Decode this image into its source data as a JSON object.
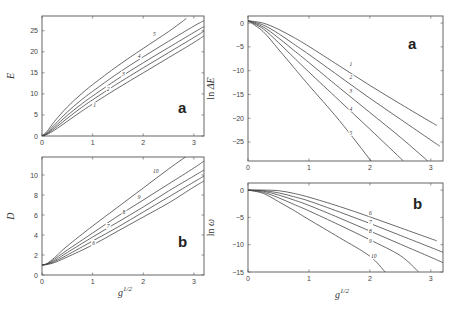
{
  "chart_data": [
    {
      "type": "line",
      "panel": "top-left",
      "panel_label": "a",
      "xlabel": "",
      "ylabel": "E",
      "xlim": [
        0,
        3.2
      ],
      "ylim": [
        0,
        28.5
      ],
      "xticks": [
        0,
        1,
        2,
        3
      ],
      "yticks": [
        0,
        5,
        10,
        15,
        20,
        25
      ],
      "xtick_labels": [
        "0",
        "1",
        "2",
        "3"
      ],
      "ytick_labels": [
        "0",
        "5",
        "10",
        "15",
        "20",
        "25"
      ],
      "grid": false,
      "series": [
        {
          "name": "1",
          "x": [
            0,
            0.1,
            0.25,
            0.5,
            0.75,
            1.0,
            1.5,
            2.0,
            2.5,
            3.0,
            3.2
          ],
          "y": [
            0,
            0.4,
            1.4,
            3.5,
            5.6,
            7.6,
            11.4,
            15.0,
            18.6,
            22.2,
            23.8
          ]
        },
        {
          "name": "2",
          "x": [
            0,
            0.1,
            0.25,
            0.5,
            0.75,
            1.0,
            1.5,
            2.0,
            2.5,
            3.0,
            3.2
          ],
          "y": [
            0,
            0.5,
            1.8,
            4.2,
            6.5,
            8.6,
            12.5,
            16.2,
            19.8,
            23.4,
            24.9
          ]
        },
        {
          "name": "3",
          "x": [
            0,
            0.1,
            0.25,
            0.5,
            0.75,
            1.0,
            1.5,
            2.0,
            2.5,
            3.0,
            3.2
          ],
          "y": [
            0,
            0.6,
            2.2,
            4.9,
            7.3,
            9.5,
            13.6,
            17.4,
            21.0,
            24.6,
            26.0
          ]
        },
        {
          "name": "4",
          "x": [
            0,
            0.1,
            0.25,
            0.5,
            0.75,
            1.0,
            1.5,
            2.0,
            2.5,
            3.0,
            3.2
          ],
          "y": [
            0,
            0.8,
            2.7,
            5.7,
            8.3,
            10.6,
            14.9,
            18.8,
            22.5,
            26.1,
            27.4
          ]
        },
        {
          "name": "5",
          "x": [
            0,
            0.1,
            0.25,
            0.5,
            0.75,
            1.0,
            1.5,
            2.0,
            2.5,
            2.85
          ],
          "y": [
            0,
            1.1,
            3.5,
            6.9,
            9.7,
            12.2,
            16.7,
            20.8,
            24.8,
            27.9
          ]
        }
      ],
      "curve_label_positions": [
        {
          "name": "1",
          "x": 1.05,
          "y": 6.8
        },
        {
          "name": "2",
          "x": 1.32,
          "y": 10.8
        },
        {
          "name": "3",
          "x": 1.62,
          "y": 14.3
        },
        {
          "name": "4",
          "x": 1.93,
          "y": 18.5
        },
        {
          "name": "5",
          "x": 2.23,
          "y": 23.8
        }
      ]
    },
    {
      "type": "line",
      "panel": "bottom-left",
      "panel_label": "b",
      "xlabel": "g^1/2",
      "ylabel": "D",
      "xlim": [
        0,
        3.2
      ],
      "ylim": [
        0,
        11.8
      ],
      "xticks": [
        0,
        1,
        2,
        3
      ],
      "yticks": [
        0,
        2,
        4,
        6,
        8,
        10
      ],
      "xtick_labels": [
        "0",
        "1",
        "2",
        "3"
      ],
      "ytick_labels": [
        "0",
        "2",
        "4",
        "6",
        "8",
        "10"
      ],
      "grid": false,
      "series": [
        {
          "name": "6",
          "x": [
            0,
            0.1,
            0.25,
            0.5,
            1.0,
            1.5,
            2.0,
            2.5,
            3.0,
            3.2
          ],
          "y": [
            1,
            1.05,
            1.25,
            1.8,
            3.0,
            4.4,
            5.8,
            7.2,
            8.8,
            9.4
          ]
        },
        {
          "name": "7",
          "x": [
            0,
            0.1,
            0.25,
            0.5,
            1.0,
            1.5,
            2.0,
            2.5,
            3.0,
            3.2
          ],
          "y": [
            1,
            1.08,
            1.35,
            2.0,
            3.4,
            4.8,
            6.3,
            7.8,
            9.3,
            9.9
          ]
        },
        {
          "name": "8",
          "x": [
            0,
            0.1,
            0.25,
            0.5,
            1.0,
            1.5,
            2.0,
            2.5,
            3.0,
            3.2
          ],
          "y": [
            1,
            1.1,
            1.45,
            2.25,
            3.8,
            5.3,
            6.8,
            8.4,
            9.9,
            10.5
          ]
        },
        {
          "name": "9",
          "x": [
            0,
            0.1,
            0.25,
            0.5,
            1.0,
            1.5,
            2.0,
            2.5,
            3.0,
            3.2
          ],
          "y": [
            1,
            1.12,
            1.6,
            2.5,
            4.2,
            5.9,
            7.5,
            9.1,
            10.7,
            11.4
          ]
        },
        {
          "name": "10",
          "x": [
            0,
            0.1,
            0.25,
            0.5,
            1.0,
            1.5,
            2.0,
            2.5,
            3.0
          ],
          "y": [
            1,
            1.15,
            1.75,
            2.9,
            4.9,
            6.8,
            8.7,
            10.6,
            12.4
          ]
        }
      ],
      "curve_label_positions": [
        {
          "name": "6",
          "x": 1.03,
          "y": 3.0
        },
        {
          "name": "7",
          "x": 1.32,
          "y": 4.7
        },
        {
          "name": "8",
          "x": 1.63,
          "y": 6.1
        },
        {
          "name": "9",
          "x": 1.93,
          "y": 7.6
        },
        {
          "name": "10",
          "x": 2.23,
          "y": 10.2
        }
      ]
    },
    {
      "type": "line",
      "panel": "top-right",
      "panel_label": "a",
      "xlabel": "",
      "ylabel": "ln ΔE",
      "xlim": [
        0,
        3.2
      ],
      "ylim": [
        -29,
        1.5
      ],
      "xticks": [
        0,
        1,
        2,
        3
      ],
      "yticks": [
        0,
        -5,
        -10,
        -15,
        -20,
        -25
      ],
      "xtick_labels": [
        "0",
        "1",
        "2",
        "3"
      ],
      "ytick_labels": [
        "0",
        "−5",
        "−10",
        "−15",
        "−20",
        "−25"
      ],
      "grid": false,
      "series": [
        {
          "name": "1",
          "x": [
            0,
            0.25,
            0.5,
            0.75,
            1.0,
            1.5,
            2.0,
            2.5,
            3.0,
            3.1
          ],
          "y": [
            0.5,
            0.0,
            -1.3,
            -3.0,
            -4.9,
            -9.0,
            -13.1,
            -17.0,
            -20.8,
            -21.5
          ]
        },
        {
          "name": "2",
          "x": [
            0,
            0.25,
            0.5,
            0.75,
            1.0,
            1.5,
            2.0,
            2.5,
            3.0,
            3.15
          ],
          "y": [
            0.5,
            -0.4,
            -2.2,
            -4.4,
            -6.6,
            -11.2,
            -15.8,
            -20.2,
            -24.6,
            -25.9
          ]
        },
        {
          "name": "3",
          "x": [
            0,
            0.25,
            0.5,
            0.75,
            1.0,
            1.5,
            2.0,
            2.5,
            2.95
          ],
          "y": [
            0.5,
            -0.8,
            -3.1,
            -5.7,
            -8.3,
            -13.6,
            -18.8,
            -24.0,
            -29.0
          ]
        },
        {
          "name": "4",
          "x": [
            0,
            0.25,
            0.5,
            0.75,
            1.0,
            1.5,
            2.0,
            2.55
          ],
          "y": [
            0.5,
            -1.2,
            -4.1,
            -7.2,
            -10.3,
            -16.3,
            -22.3,
            -29.0
          ]
        },
        {
          "name": "5",
          "x": [
            0,
            0.25,
            0.5,
            0.75,
            1.0,
            1.5,
            2.02
          ],
          "y": [
            0.5,
            -1.8,
            -5.5,
            -9.3,
            -13.1,
            -20.5,
            -29.0
          ]
        }
      ],
      "curve_label_positions": [
        {
          "name": "1",
          "x": 1.7,
          "y": -9.0
        },
        {
          "name": "2",
          "x": 1.7,
          "y": -11.8
        },
        {
          "name": "3",
          "x": 1.7,
          "y": -14.8
        },
        {
          "name": "4",
          "x": 1.7,
          "y": -18.4
        },
        {
          "name": "5",
          "x": 1.7,
          "y": -23.5
        }
      ]
    },
    {
      "type": "line",
      "panel": "bottom-right",
      "panel_label": "b",
      "xlabel": "g^1/2",
      "ylabel": "ln ω",
      "xlim": [
        0,
        3.2
      ],
      "ylim": [
        -15,
        1.3
      ],
      "xticks": [
        0,
        1,
        2,
        3
      ],
      "yticks": [
        0,
        -5,
        -10,
        -15
      ],
      "xtick_labels": [
        "0",
        "1",
        "2",
        "3"
      ],
      "ytick_labels": [
        "0",
        "−5",
        "−10",
        "−15"
      ],
      "grid": false,
      "series": [
        {
          "name": "6",
          "x": [
            0,
            0.25,
            0.5,
            0.75,
            1.0,
            1.5,
            2.0,
            2.5,
            3.0,
            3.1
          ],
          "y": [
            0,
            0.0,
            -0.1,
            -0.6,
            -1.3,
            -3.0,
            -4.9,
            -6.9,
            -8.9,
            -9.3
          ]
        },
        {
          "name": "7",
          "x": [
            0,
            0.25,
            0.5,
            0.75,
            1.0,
            1.5,
            2.0,
            2.5,
            3.0,
            3.2
          ],
          "y": [
            0,
            -0.1,
            -0.5,
            -1.2,
            -2.0,
            -4.0,
            -6.1,
            -8.3,
            -10.5,
            -11.4
          ]
        },
        {
          "name": "8",
          "x": [
            0,
            0.25,
            0.5,
            0.75,
            1.0,
            1.5,
            2.0,
            2.5,
            3.0,
            3.2
          ],
          "y": [
            0,
            -0.2,
            -0.9,
            -1.8,
            -2.8,
            -5.1,
            -7.5,
            -9.9,
            -12.3,
            -13.3
          ]
        },
        {
          "name": "9",
          "x": [
            0,
            0.25,
            0.5,
            0.75,
            1.0,
            1.5,
            2.0,
            2.5,
            2.8
          ],
          "y": [
            0,
            -0.4,
            -1.4,
            -2.6,
            -3.8,
            -6.4,
            -9.1,
            -12.0,
            -15.0
          ]
        },
        {
          "name": "10",
          "x": [
            0,
            0.25,
            0.5,
            0.75,
            1.0,
            1.5,
            2.0,
            2.25
          ],
          "y": [
            0,
            -0.6,
            -2.1,
            -3.7,
            -5.4,
            -8.7,
            -12.1,
            -15.0
          ]
        }
      ],
      "curve_label_positions": [
        {
          "name": "6",
          "x": 2.02,
          "y": -4.6
        },
        {
          "name": "7",
          "x": 2.02,
          "y": -6.2
        },
        {
          "name": "8",
          "x": 2.02,
          "y": -7.9
        },
        {
          "name": "9",
          "x": 2.02,
          "y": -9.6
        },
        {
          "name": "10",
          "x": 2.05,
          "y": -12.5
        }
      ]
    }
  ]
}
